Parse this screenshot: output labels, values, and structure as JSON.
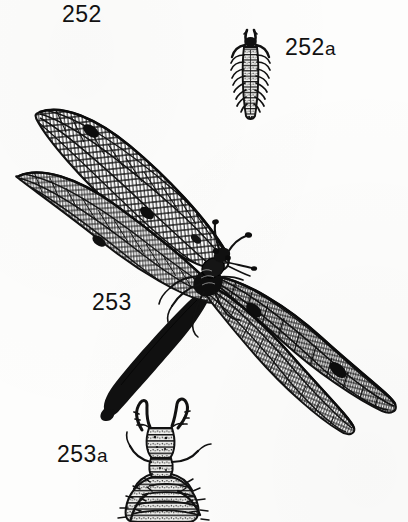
{
  "plate": {
    "kind": "natural-history-engraving",
    "subject": "antlion (Myrmeleontidae) adult and larvae",
    "background_color": "#fdfdfc",
    "ink_color": "#111111"
  },
  "labels": {
    "fig_252": "252",
    "fig_252a_num": "252",
    "fig_252a_suffix": "a",
    "fig_253": "253",
    "fig_253a_num": "253",
    "fig_253a_suffix": "a"
  },
  "figures": [
    {
      "id": "fig-252a-larva",
      "label": "252a",
      "caption": "252a",
      "description": "elongate segmented larva with lateral bristles and mandibles",
      "bbox": [
        234,
        28,
        46,
        92
      ]
    },
    {
      "id": "fig-253-adult",
      "label": "253",
      "caption": "253",
      "description": "adult antlion with four net-veined wings, clubbed antennae and long slender abdomen",
      "bbox": [
        12,
        104,
        386,
        320
      ]
    },
    {
      "id": "fig-253a-larva",
      "label": "253a",
      "caption": "253a",
      "description": "stout bristly antlion larva with large curved mandibles",
      "bbox": [
        112,
        398,
        120,
        124
      ]
    }
  ]
}
